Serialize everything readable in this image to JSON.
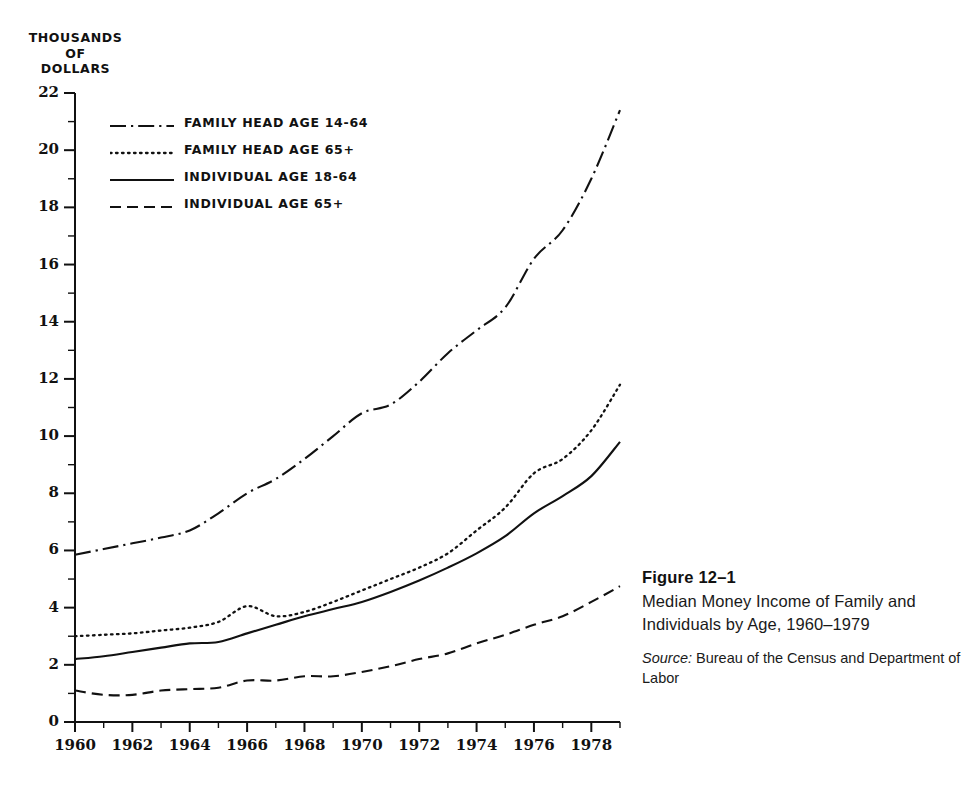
{
  "figure": {
    "caption_title": "Figure  12–1",
    "caption_body": "Median Money Income of Family and Individuals by Age, 1960–1979",
    "source_label": "Source:",
    "source_text": " Bureau of the Census and Department of Labor"
  },
  "axes": {
    "y_title_lines": [
      "THOUSANDS",
      "OF",
      "DOLLARS"
    ],
    "y_ticks": [
      "0",
      "2",
      "4",
      "6",
      "8",
      "10",
      "12",
      "14",
      "16",
      "18",
      "20",
      "22"
    ],
    "x_ticks": [
      "1960",
      "1962",
      "1964",
      "1966",
      "1968",
      "1970",
      "1972",
      "1974",
      "1976",
      "1978"
    ]
  },
  "legend": {
    "items": [
      {
        "label": "FAMILY HEAD AGE 14-64",
        "style": "dashdot",
        "sample": "dashdot-line-sample"
      },
      {
        "label": "FAMILY HEAD AGE 65+",
        "style": "dotted",
        "sample": "dotted-line-sample"
      },
      {
        "label": "INDIVIDUAL AGE 18-64",
        "style": "solid",
        "sample": "solid-line-sample"
      },
      {
        "label": "INDIVIDUAL AGE 65+",
        "style": "dashed",
        "sample": "dashed-line-sample"
      }
    ]
  },
  "colors": {
    "ink": "#111111",
    "background": "#ffffff"
  },
  "chart_data": {
    "type": "line",
    "title": "Median Money Income of Family and Individuals by Age, 1960–1979",
    "xlabel": "",
    "ylabel": "THOUSANDS OF DOLLARS",
    "xlim": [
      1960,
      1979
    ],
    "ylim": [
      0,
      22
    ],
    "grid": false,
    "legend_position": "upper-left",
    "x": [
      1960,
      1961,
      1962,
      1963,
      1964,
      1965,
      1966,
      1967,
      1968,
      1969,
      1970,
      1971,
      1972,
      1973,
      1974,
      1975,
      1976,
      1977,
      1978,
      1979
    ],
    "series": [
      {
        "name": "FAMILY HEAD AGE 14-64",
        "style": "dashdot",
        "values": [
          5.85,
          6.05,
          6.25,
          6.45,
          6.7,
          7.3,
          8.0,
          8.5,
          9.2,
          10.0,
          10.8,
          11.1,
          11.9,
          12.9,
          13.7,
          14.5,
          16.2,
          17.2,
          19.0,
          21.4
        ]
      },
      {
        "name": "FAMILY HEAD AGE 65+",
        "style": "dotted",
        "values": [
          3.0,
          3.05,
          3.1,
          3.2,
          3.3,
          3.5,
          4.05,
          3.7,
          3.85,
          4.2,
          4.6,
          5.0,
          5.4,
          5.9,
          6.7,
          7.5,
          8.7,
          9.2,
          10.2,
          11.8
        ]
      },
      {
        "name": "INDIVIDUAL AGE 18-64",
        "style": "solid",
        "values": [
          2.2,
          2.3,
          2.45,
          2.6,
          2.75,
          2.8,
          3.1,
          3.4,
          3.7,
          3.95,
          4.2,
          4.55,
          4.95,
          5.4,
          5.9,
          6.5,
          7.3,
          7.9,
          8.6,
          9.8
        ]
      },
      {
        "name": "INDIVIDUAL AGE 65+",
        "style": "dashed",
        "values": [
          1.1,
          0.95,
          0.95,
          1.1,
          1.15,
          1.2,
          1.45,
          1.45,
          1.6,
          1.6,
          1.75,
          1.95,
          2.2,
          2.4,
          2.75,
          3.05,
          3.4,
          3.7,
          4.2,
          4.75
        ]
      }
    ]
  }
}
